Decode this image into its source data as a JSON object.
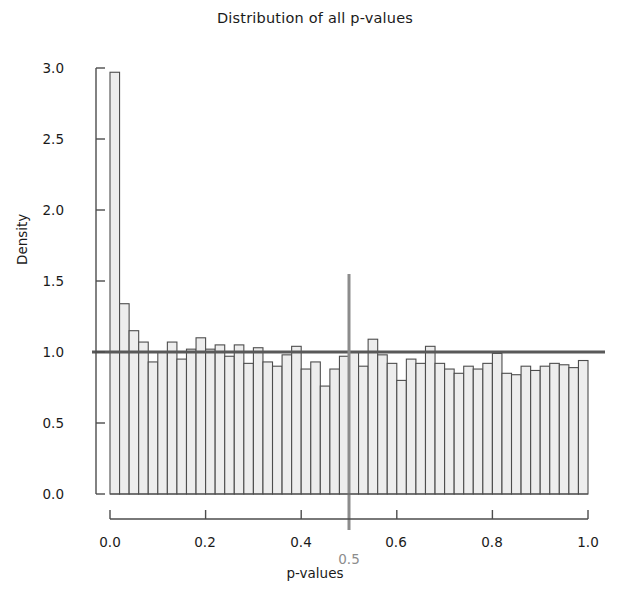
{
  "chart_data": {
    "type": "bar",
    "title": "Distribution of all p-values",
    "xlabel": "p-values",
    "ylabel": "Density",
    "xlim": [
      0.0,
      1.0
    ],
    "ylim": [
      0.0,
      3.0
    ],
    "grid": false,
    "legend": null,
    "bin_width": 0.02,
    "n_bins": 50,
    "bar_fill_color": "#ededed",
    "bar_edge_color": "#4d4d4d",
    "reference_lines": [
      {
        "name": "density-one-line",
        "orientation": "horizontal",
        "value": 1.0,
        "color": "#595959"
      },
      {
        "name": "p-half-line",
        "orientation": "vertical",
        "value": 0.5,
        "color": "#8c8c8c",
        "label": "0.5"
      }
    ],
    "annotations": [
      {
        "name": "vline-label-half",
        "text": "0.5",
        "x": 0.5,
        "color": "#8c8c8c"
      }
    ],
    "x_tick_labels": [
      "0.0",
      "0.2",
      "0.4",
      "0.6",
      "0.8",
      "1.0"
    ],
    "x_tick_values": [
      0.0,
      0.2,
      0.4,
      0.6,
      0.8,
      1.0
    ],
    "y_tick_labels": [
      "0.0",
      "0.5",
      "1.0",
      "1.5",
      "2.0",
      "2.5",
      "3.0"
    ],
    "y_tick_values": [
      0.0,
      0.5,
      1.0,
      1.5,
      2.0,
      2.5,
      3.0
    ],
    "bin_centers": [
      0.01,
      0.03,
      0.05,
      0.07,
      0.09,
      0.11,
      0.13,
      0.15,
      0.17,
      0.19,
      0.21,
      0.23,
      0.25,
      0.27,
      0.29,
      0.31,
      0.33,
      0.35,
      0.37,
      0.39,
      0.41,
      0.43,
      0.45,
      0.47,
      0.49,
      0.51,
      0.53,
      0.55,
      0.57,
      0.59,
      0.61,
      0.63,
      0.65,
      0.67,
      0.69,
      0.71,
      0.73,
      0.75,
      0.77,
      0.79,
      0.81,
      0.83,
      0.85,
      0.87,
      0.89,
      0.91,
      0.93,
      0.95,
      0.97,
      0.99
    ],
    "bin_edges": [
      0.0,
      0.02,
      0.04,
      0.06,
      0.08,
      0.1,
      0.12,
      0.14,
      0.16,
      0.18,
      0.2,
      0.22,
      0.24,
      0.26,
      0.28,
      0.3,
      0.32,
      0.34,
      0.36,
      0.38,
      0.4,
      0.42,
      0.44,
      0.46,
      0.48,
      0.5,
      0.52,
      0.54,
      0.56,
      0.58,
      0.6,
      0.62,
      0.64,
      0.66,
      0.68,
      0.7,
      0.72,
      0.74,
      0.76,
      0.78,
      0.8,
      0.82,
      0.84,
      0.86,
      0.88,
      0.9,
      0.92,
      0.94,
      0.96,
      0.98,
      1.0
    ],
    "values": [
      2.97,
      1.34,
      1.15,
      1.07,
      0.93,
      1.0,
      1.07,
      0.95,
      1.02,
      1.1,
      1.02,
      1.05,
      0.97,
      1.05,
      0.92,
      1.03,
      0.93,
      0.9,
      0.98,
      1.04,
      0.88,
      0.93,
      0.76,
      0.88,
      0.97,
      1.0,
      0.9,
      1.09,
      0.98,
      0.92,
      0.8,
      0.95,
      0.92,
      1.04,
      0.92,
      0.88,
      0.85,
      0.9,
      0.88,
      0.92,
      0.99,
      0.85,
      0.84,
      0.9,
      0.87,
      0.9,
      0.92,
      0.91,
      0.89,
      0.94
    ]
  }
}
